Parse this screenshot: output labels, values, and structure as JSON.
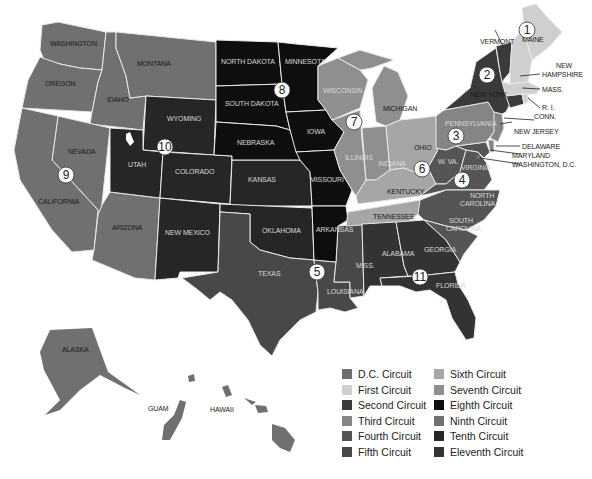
{
  "colors": {
    "dc": "#6e6e6e",
    "first": "#cfcfcf",
    "second": "#3a3a3a",
    "third": "#858585",
    "fourth": "#555555",
    "fifth": "#484848",
    "sixth": "#a6a6a6",
    "seventh": "#8f8f8f",
    "eighth": "#0e0e0e",
    "ninth": "#707070",
    "tenth": "#262626",
    "eleventh": "#333333"
  },
  "states": {
    "washington": "WASHINGTON",
    "oregon": "OREGON",
    "california": "CALIFORNIA",
    "nevada": "NEVADA",
    "idaho": "IDAHO",
    "montana": "MONTANA",
    "arizona": "ARIZONA",
    "alaska": "ALASKA",
    "guam": "GUAM",
    "hawaii": "HAWAII",
    "wyoming": "WYOMING",
    "utah": "UTAH",
    "colorado": "COLORADO",
    "new_mexico": "NEW MEXICO",
    "kansas": "KANSAS",
    "oklahoma": "OKLAHOMA",
    "north_dakota": "NORTH DAKOTA",
    "south_dakota": "SOUTH DAKOTA",
    "nebraska": "NEBRASKA",
    "minnesota": "MINNESOTA",
    "iowa": "IOWA",
    "missouri": "MISSOURI",
    "arkansas": "ARKANSAS",
    "texas": "TEXAS",
    "louisiana": "LOUISIANA",
    "mississippi": "MISS.",
    "wisconsin": "WISCONSIN",
    "illinois": "ILLINOIS",
    "indiana": "INDIANA",
    "michigan": "MICHIGAN",
    "ohio": "OHIO",
    "kentucky": "KENTUCKY",
    "tennessee": "TENNESSEE",
    "pennsylvania": "PENNSYLVANIA",
    "new_jersey": "NEW JERSEY",
    "delaware": "DELAWARE",
    "maryland": "MARYLAND",
    "washington_dc": "WASHINGTON, D.C.",
    "west_virginia": "W. VA.",
    "virginia": "VIRGINIA",
    "north_carolina_1": "NORTH",
    "north_carolina_2": "CAROLINA",
    "south_carolina_1": "SOUTH",
    "south_carolina_2": "CAROLINA",
    "alabama": "ALABAMA",
    "georgia": "GEORGIA",
    "florida": "FLORIDA",
    "new_york": "NEW YORK",
    "vermont": "VERMONT",
    "maine": "MAINE",
    "new_hampshire_1": "NEW",
    "new_hampshire_2": "HAMPSHIRE",
    "massachusetts": "MASS.",
    "rhode_island": "R. I.",
    "connecticut": "CONN."
  },
  "circuit_numbers": {
    "c1": "1",
    "c2": "2",
    "c3": "3",
    "c4": "4",
    "c5": "5",
    "c6": "6",
    "c7": "7",
    "c8": "8",
    "c9": "9",
    "c10": "10",
    "c11": "11"
  },
  "legend": [
    {
      "label": "D.C. Circuit",
      "color": "#6e6e6e"
    },
    {
      "label": "Sixth Circuit",
      "color": "#a6a6a6"
    },
    {
      "label": "First Circuit",
      "color": "#cfcfcf"
    },
    {
      "label": "Seventh Circuit",
      "color": "#8f8f8f"
    },
    {
      "label": "Second Circuit",
      "color": "#3a3a3a"
    },
    {
      "label": "Eighth Circuit",
      "color": "#0e0e0e"
    },
    {
      "label": "Third Circuit",
      "color": "#858585"
    },
    {
      "label": "Ninth Circuit",
      "color": "#707070"
    },
    {
      "label": "Fourth Circuit",
      "color": "#555555"
    },
    {
      "label": "Tenth Circuit",
      "color": "#262626"
    },
    {
      "label": "Fifth Circuit",
      "color": "#484848"
    },
    {
      "label": "Eleventh Circuit",
      "color": "#333333"
    }
  ]
}
